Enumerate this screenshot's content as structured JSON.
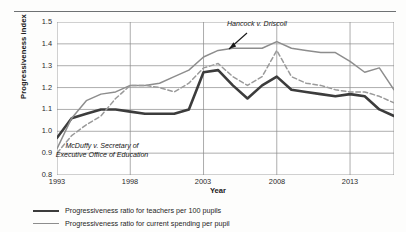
{
  "chart_data": {
    "type": "line",
    "title": "",
    "xlabel": "Year",
    "ylabel": "Progressiveness index",
    "xlim": [
      1993,
      2016
    ],
    "ylim": [
      0.8,
      1.5
    ],
    "xticks": [
      "1993",
      "1998",
      "2003",
      "2008",
      "2013"
    ],
    "yticks": [
      "0.8",
      "0.9",
      "1.0",
      "1.1",
      "1.2",
      "1.3",
      "1.4",
      "1.5"
    ],
    "grid": true,
    "legend_position": "bottom-left",
    "x": [
      1993,
      1994,
      1995,
      1996,
      1997,
      1998,
      1999,
      2000,
      2001,
      2002,
      2003,
      2004,
      2005,
      2006,
      2007,
      2008,
      2009,
      2010,
      2011,
      2012,
      2013,
      2014,
      2015,
      2016
    ],
    "series": [
      {
        "name": "Progressiveness ratio for teachers per 100 pupils",
        "style": "solid",
        "color": "#3c3c3c",
        "width": 2.6,
        "values": [
          0.97,
          1.06,
          1.08,
          1.1,
          1.1,
          1.09,
          1.08,
          1.08,
          1.08,
          1.1,
          1.27,
          1.28,
          1.21,
          1.15,
          1.21,
          1.25,
          1.19,
          1.18,
          1.17,
          1.16,
          1.17,
          1.16,
          1.1,
          1.07
        ]
      },
      {
        "name": "Progressiveness ratio for current spending per pupil",
        "style": "solid",
        "color": "#8d8d8d",
        "width": 1.5,
        "values": [
          0.92,
          1.06,
          1.14,
          1.17,
          1.18,
          1.21,
          1.21,
          1.22,
          1.25,
          1.28,
          1.34,
          1.37,
          1.38,
          1.38,
          1.38,
          1.41,
          1.38,
          1.37,
          1.36,
          1.36,
          1.32,
          1.27,
          1.29,
          1.19
        ]
      },
      {
        "name": "Progressiveness ratio (dashed series)",
        "style": "dashed",
        "color": "#9a9a9a",
        "width": 1.5,
        "values": [
          0.9,
          0.98,
          1.03,
          1.07,
          1.15,
          1.21,
          1.21,
          1.2,
          1.18,
          1.22,
          1.29,
          1.31,
          1.25,
          1.21,
          1.25,
          1.37,
          1.25,
          1.22,
          1.21,
          1.19,
          1.18,
          1.18,
          1.16,
          1.13
        ]
      }
    ],
    "annotations": [
      {
        "id": "mcduffy",
        "text": "McDuffy v. Secretary of Executive Office of Education",
        "style": "italic"
      },
      {
        "id": "hancock",
        "text": "Hancock v. Driscoll",
        "style": "italic",
        "arrow": true
      }
    ]
  },
  "legend": {
    "items": [
      {
        "label": "Progressiveness ratio for teachers per 100 pupils"
      },
      {
        "label": "Progressiveness ratio for current spending per pupil"
      }
    ]
  }
}
